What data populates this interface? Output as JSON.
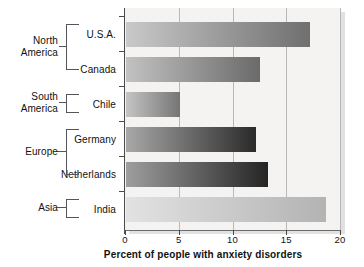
{
  "chart_data": {
    "type": "bar",
    "orientation": "horizontal",
    "title": "",
    "xlabel": "Percent of people with anxiety disorders",
    "ylabel": "",
    "xlim": [
      0,
      20
    ],
    "xticks": [
      0,
      5,
      10,
      15,
      20
    ],
    "xtick_labels": [
      "0",
      "5",
      "10",
      "15",
      "20"
    ],
    "grid": true,
    "legend": "none",
    "categories": [
      "U.S.A.",
      "Canada",
      "Chile",
      "Germany",
      "Netherlands",
      "India"
    ],
    "values": [
      17.2,
      12.5,
      5.0,
      12.1,
      13.3,
      18.7
    ],
    "groups": [
      {
        "region": "North America",
        "countries": [
          "U.S.A.",
          "Canada"
        ]
      },
      {
        "region": "South America",
        "countries": [
          "Chile"
        ]
      },
      {
        "region": "Europe",
        "countries": [
          "Germany",
          "Netherlands"
        ]
      },
      {
        "region": "Asia",
        "countries": [
          "India"
        ]
      }
    ],
    "bars": [
      {
        "label": "U.S.A.",
        "value": 17.2,
        "region": "North America",
        "gradient_start": "#c9c9c9",
        "gradient_end": "#6f6f6f"
      },
      {
        "label": "Canada",
        "value": 12.5,
        "region": "North America",
        "gradient_start": "#c2c2c2",
        "gradient_end": "#6a6a6a"
      },
      {
        "label": "Chile",
        "value": 5.0,
        "region": "South America",
        "gradient_start": "#c4c4c4",
        "gradient_end": "#757575"
      },
      {
        "label": "Germany",
        "value": 12.1,
        "region": "Europe",
        "gradient_start": "#a8a8a8",
        "gradient_end": "#2a2a2a"
      },
      {
        "label": "Netherlands",
        "value": 13.3,
        "region": "Europe",
        "gradient_start": "#9e9e9e",
        "gradient_end": "#242424"
      },
      {
        "label": "India",
        "value": 18.7,
        "region": "Asia",
        "gradient_start": "#e2e2e2",
        "gradient_end": "#b3b3b3"
      }
    ]
  },
  "axis": {
    "x_title": "Percent of people with anxiety disorders",
    "tick_0": "0",
    "tick_5": "5",
    "tick_10": "10",
    "tick_15": "15",
    "tick_20": "20"
  },
  "labels": {
    "usa": "U.S.A.",
    "canada": "Canada",
    "chile": "Chile",
    "germany": "Germany",
    "netherlands": "Netherlands",
    "india": "India"
  },
  "regions": {
    "north_america_line1": "North",
    "north_america_line2": "America",
    "south_america_line1": "South",
    "south_america_line2": "America",
    "europe": "Europe",
    "asia": "Asia"
  }
}
